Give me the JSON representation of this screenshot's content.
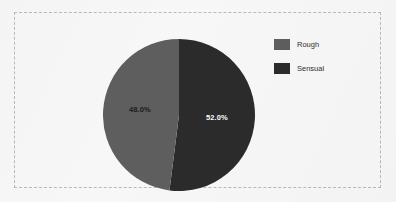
{
  "figure": {
    "background_color": "#f7f7f7",
    "frame_border_color": "#b9b9b9",
    "frame_border_style": "dashed"
  },
  "legend": {
    "position": "right",
    "items": [
      {
        "label": "Rough",
        "color": "#5e5e5e"
      },
      {
        "label": "Sensual",
        "color": "#2b2b2b"
      }
    ]
  },
  "labels": {
    "rough_pct": "48.0%",
    "sensual_pct": "52.0%"
  },
  "chart_data": {
    "type": "pie",
    "title": "",
    "categories": [
      "Rough",
      "Sensual"
    ],
    "values": [
      48.0,
      52.0
    ],
    "value_labels": [
      "48.0%",
      "52.0%"
    ],
    "colors": [
      "#5e5e5e",
      "#2b2b2b"
    ],
    "units": "percent",
    "start_angle_deg": 90,
    "direction": "clockwise",
    "legend": "right",
    "grid": false,
    "xlabel": "",
    "ylabel": ""
  }
}
